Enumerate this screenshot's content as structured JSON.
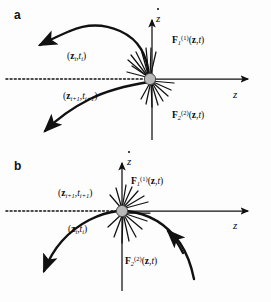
{
  "figure": {
    "type": "phase-space-diagram",
    "background": "#ffffff",
    "stroke_color": "#111111",
    "node_fill": "#b9b9b9",
    "node_stroke": "#333333",
    "width": 271,
    "height": 302
  },
  "panels": [
    {
      "id": "a",
      "label": "a",
      "axes": {
        "x_label_plain": "z",
        "y_label_plain": "z",
        "y_label_accent": "dot",
        "x_axis_style": "dotted-left-solid-right",
        "y_axis_style": "solid"
      },
      "node": {
        "shape": "circle",
        "description": "impact point at origin"
      },
      "labels": [
        {
          "name": "state-upper",
          "text": "(z_i, t_i)",
          "z": "z",
          "z_sub": "i",
          "t": "t",
          "t_sub": "i"
        },
        {
          "name": "state-lower",
          "text": "(z_i+1, t_i+1)",
          "z": "z",
          "z_sub": "i+1",
          "t": "t",
          "t_sub": "i+1"
        },
        {
          "name": "force-upper",
          "base": "F",
          "sub": "1",
          "sup": "(1)",
          "args": "(z, t)"
        },
        {
          "name": "force-lower",
          "base": "F",
          "sub": "2",
          "sup": "(2)",
          "args": "(z, t)"
        }
      ]
    },
    {
      "id": "b",
      "label": "b",
      "axes": {
        "x_label_plain": "z",
        "y_label_plain": "z",
        "y_label_accent": "dot",
        "x_axis_style": "dotted-left-solid-right",
        "y_axis_style": "solid"
      },
      "node": {
        "shape": "circle",
        "description": "grazing point at origin"
      },
      "labels": [
        {
          "name": "state-upper",
          "text": "(z_i+1, t_i+1)",
          "z": "z",
          "z_sub": "i+1",
          "t": "t",
          "t_sub": "i+1"
        },
        {
          "name": "state-lower",
          "text": "(z_i, t_i)",
          "z": "z",
          "z_sub": "i",
          "t": "t",
          "t_sub": "i"
        },
        {
          "name": "force-upper",
          "base": "F",
          "sub": "1",
          "sup": "(1)",
          "args": "(z, t)"
        },
        {
          "name": "force-lower",
          "base": "F",
          "sub": "2",
          "sup": "(2)",
          "args": "(z, t)"
        }
      ]
    }
  ],
  "glyphs": {
    "open_paren": "(",
    "close_paren": ")",
    "comma": ",",
    "z_var": "z",
    "t_var": "t",
    "F_var": "F",
    "sub_i": "i",
    "sub_i1": "i+1",
    "sub_1": "1",
    "sub_2": "2",
    "sup_1": "(1)",
    "sup_2": "(2)",
    "args_zt": "(z,t)"
  }
}
